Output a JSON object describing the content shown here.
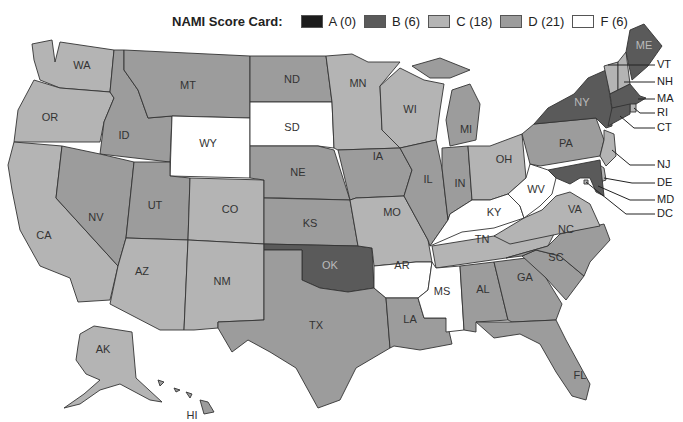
{
  "legend": {
    "title": "NAMI Score Card:",
    "items": [
      {
        "grade": "A",
        "label": "A (0)",
        "count": 0,
        "color": "#1c1c1c"
      },
      {
        "grade": "B",
        "label": "B (6)",
        "count": 6,
        "color": "#5a5a5a"
      },
      {
        "grade": "C",
        "label": "C (18)",
        "count": 18,
        "color": "#b4b4b4"
      },
      {
        "grade": "D",
        "label": "D (21)",
        "count": 21,
        "color": "#9c9c9c"
      },
      {
        "grade": "F",
        "label": "F (6)",
        "count": 6,
        "color": "#ffffff"
      }
    ]
  },
  "colors": {
    "A": "#1c1c1c",
    "B": "#5a5a5a",
    "C": "#b4b4b4",
    "D": "#9c9c9c",
    "F": "#ffffff"
  },
  "states": {
    "WA": "C",
    "OR": "C",
    "CA": "C",
    "ID": "D",
    "NV": "D",
    "MT": "D",
    "WY": "F",
    "UT": "D",
    "AZ": "C",
    "CO": "C",
    "NM": "C",
    "ND": "D",
    "SD": "F",
    "NE": "D",
    "KS": "D",
    "OK": "B",
    "TX": "D",
    "MN": "C",
    "IA": "D",
    "MO": "C",
    "AR": "F",
    "LA": "D",
    "WI": "C",
    "IL": "D",
    "MI": "D",
    "IN": "D",
    "OH": "C",
    "KY": "F",
    "TN": "C",
    "MS": "F",
    "AL": "D",
    "GA": "D",
    "FL": "D",
    "SC": "D",
    "NC": "D",
    "VA": "C",
    "WV": "F",
    "PA": "D",
    "NY": "B",
    "ME": "B",
    "VT": "C",
    "NH": "C",
    "MA": "B",
    "RI": "C",
    "CT": "B",
    "NJ": "C",
    "DE": "C",
    "MD": "B",
    "DC": "C",
    "AK": "C",
    "HI": "D"
  },
  "labels": {
    "WA": "WA",
    "OR": "OR",
    "CA": "CA",
    "ID": "ID",
    "NV": "NV",
    "MT": "MT",
    "WY": "WY",
    "UT": "UT",
    "AZ": "AZ",
    "CO": "CO",
    "NM": "NM",
    "ND": "ND",
    "SD": "SD",
    "NE": "NE",
    "KS": "KS",
    "OK": "OK",
    "TX": "TX",
    "MN": "MN",
    "IA": "IA",
    "MO": "MO",
    "AR": "AR",
    "LA": "LA",
    "WI": "WI",
    "IL": "IL",
    "MI": "MI",
    "IN": "IN",
    "OH": "OH",
    "KY": "KY",
    "TN": "TN",
    "MS": "MS",
    "AL": "AL",
    "GA": "GA",
    "FL": "FL",
    "SC": "SC",
    "NC": "NC",
    "VA": "VA",
    "WV": "WV",
    "PA": "PA",
    "NY": "NY",
    "ME": "ME",
    "AK": "AK",
    "HI": "HI"
  },
  "callouts": [
    "VT",
    "NH",
    "MA",
    "RI",
    "CT",
    "NJ",
    "DE",
    "MD",
    "DC"
  ]
}
